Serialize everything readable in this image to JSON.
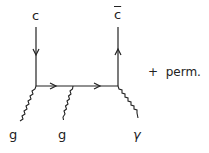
{
  "diagram": {
    "type": "feynman",
    "labels": {
      "quark_in": "c",
      "antiquark_out": "c",
      "gluon_left": "g",
      "gluon_middle": "g",
      "photon": "γ",
      "annotation": "+  perm."
    },
    "colors": {
      "line": "#222222",
      "background": "#ffffff"
    }
  }
}
